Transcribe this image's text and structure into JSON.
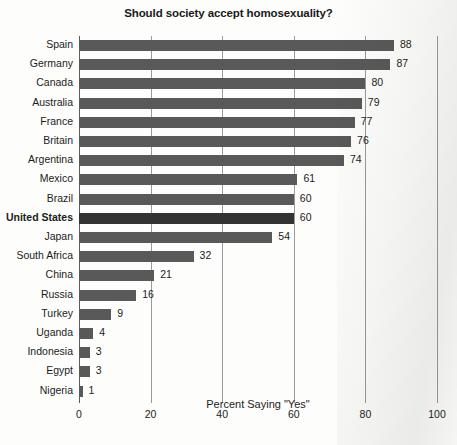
{
  "chart_data": {
    "type": "bar",
    "orientation": "horizontal",
    "title": "Should society accept homosexuality?",
    "xlabel": "Percent Saying \"Yes\"",
    "ylabel": "",
    "xlim": [
      0,
      100
    ],
    "xticks": [
      0,
      20,
      40,
      60,
      80,
      100
    ],
    "xtick_labels": [
      "0",
      "20",
      "40",
      "60",
      "80",
      "100"
    ],
    "grid": "vertical",
    "legend": "none",
    "categories": [
      "Spain",
      "Germany",
      "Canada",
      "Australia",
      "France",
      "Britain",
      "Argentina",
      "Mexico",
      "Brazil",
      "United States",
      "Japan",
      "South Africa",
      "China",
      "Russia",
      "Turkey",
      "Uganda",
      "Indonesia",
      "Egypt",
      "Nigeria"
    ],
    "values": [
      88,
      87,
      80,
      79,
      77,
      76,
      74,
      61,
      60,
      60,
      54,
      32,
      21,
      16,
      9,
      4,
      3,
      3,
      1
    ],
    "value_labels": [
      "88",
      "87",
      "80",
      "79",
      "77",
      "76",
      "74",
      "61",
      "60",
      "60",
      "54",
      "32",
      "21",
      "16",
      "9",
      "4",
      "3",
      "3",
      "1"
    ],
    "highlighted_category": "United States",
    "bar_color": "#595959",
    "highlight_color": "#333333",
    "gridline_color": "#9a9a9a",
    "axis_color": "#5c5c5c",
    "background_color": "#fdfdfb",
    "text_color": "#1c1c1c"
  }
}
